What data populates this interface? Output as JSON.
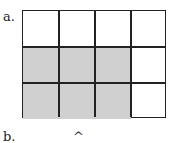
{
  "labels": {
    "a": "a.",
    "b": "b.",
    "caret": "^"
  },
  "grid": {
    "rows": 3,
    "cols": 4,
    "shaded_color": "#d0d0d0",
    "unshaded_color": "#ffffff",
    "shaded": [
      [
        false,
        false,
        false,
        false
      ],
      [
        true,
        true,
        true,
        false
      ],
      [
        true,
        true,
        true,
        false
      ]
    ]
  }
}
